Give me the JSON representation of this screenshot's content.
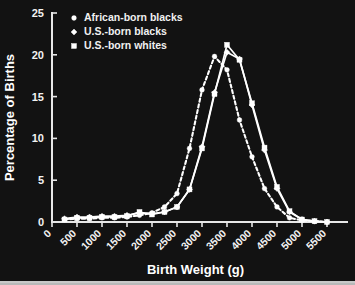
{
  "chart_data": {
    "type": "line",
    "title": "",
    "xlabel": "Birth Weight (g)",
    "ylabel": "Percentage of Births",
    "xlim": [
      0,
      5500
    ],
    "ylim": [
      0,
      25
    ],
    "xticks": [
      0,
      500,
      1000,
      1500,
      2000,
      2500,
      3000,
      3500,
      4000,
      4500,
      5000,
      5500
    ],
    "yticks": [
      0,
      5,
      10,
      15,
      20,
      25
    ],
    "xticklabels": [
      "0",
      "500",
      "1000",
      "1500",
      "2000",
      "2500",
      "3000",
      "3500",
      "4000",
      "4500",
      "5000",
      "5500"
    ],
    "yticklabels": [
      "0",
      "5",
      "10",
      "15",
      "20",
      "25"
    ],
    "grid": false,
    "legend_position": "top-left",
    "x": [
      250,
      500,
      750,
      1000,
      1250,
      1500,
      1750,
      2000,
      2250,
      2500,
      2750,
      3000,
      3250,
      3500,
      3750,
      4000,
      4250,
      4500,
      4750,
      5000,
      5250,
      5500
    ],
    "series": [
      {
        "name": "African-born blacks",
        "marker": "dot",
        "linestyle": "dashed",
        "color": "#ffffff",
        "values": [
          0.3,
          0.4,
          0.4,
          0.5,
          0.5,
          0.6,
          0.8,
          1.1,
          1.8,
          3.4,
          8.8,
          15.8,
          19.8,
          18.2,
          12.2,
          7.8,
          4.0,
          1.8,
          0.5,
          0.2,
          0.1,
          0.0
        ]
      },
      {
        "name": "U.S.-born blacks",
        "marker": "diamond",
        "linestyle": "solid",
        "color": "#ffffff",
        "values": [
          0.4,
          0.6,
          0.6,
          0.7,
          0.7,
          0.8,
          1.1,
          1.0,
          1.2,
          1.8,
          3.9,
          9.0,
          15.5,
          20.3,
          19.5,
          14.0,
          8.6,
          4.0,
          1.2,
          0.3,
          0.1,
          0.0
        ]
      },
      {
        "name": "U.S.-born whites",
        "marker": "square",
        "linestyle": "solid",
        "color": "#ffffff",
        "values": [
          0.3,
          0.5,
          0.5,
          0.6,
          0.6,
          0.7,
          1.2,
          0.9,
          1.2,
          1.8,
          3.9,
          8.8,
          15.3,
          21.2,
          19.4,
          14.2,
          8.9,
          4.2,
          1.3,
          0.3,
          0.1,
          0.0
        ]
      }
    ]
  },
  "legend": {
    "items": [
      {
        "label": "African-born blacks",
        "marker": "dot"
      },
      {
        "label": "U.S.-born blacks",
        "marker": "diamond"
      },
      {
        "label": "U.S.-born whites",
        "marker": "square"
      }
    ]
  }
}
